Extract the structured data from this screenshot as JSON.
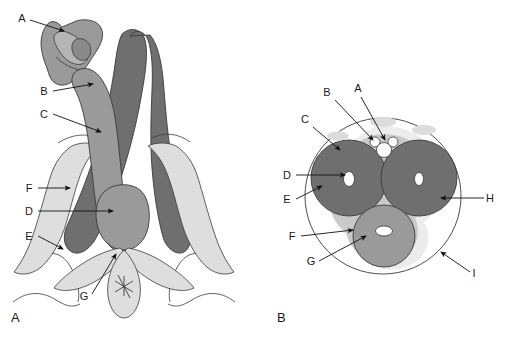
{
  "figure": {
    "background_color": "#ffffff",
    "width": 506,
    "height": 338
  },
  "palette": {
    "dark_gray": "#6f6f6f",
    "mid_gray": "#9a9a9a",
    "light_gray": "#c9c9c9",
    "pale_gray": "#dedede",
    "very_pale_gray": "#ececec",
    "outline": "#3a3a3a",
    "leader_line": "#111111",
    "label_text": "#1a1a1a",
    "white": "#ffffff"
  },
  "panels": [
    {
      "id": "panel-a",
      "caption": "A",
      "view": "coronal root view",
      "labels": [
        {
          "key": "A",
          "text": "A",
          "label_x": 22,
          "label_y": 22,
          "line": [
            [
              30,
              20
            ],
            [
              64,
              31
            ]
          ],
          "arrow_at": [
            64,
            31
          ]
        },
        {
          "key": "B",
          "text": "B",
          "label_x": 44,
          "label_y": 95,
          "line": [
            [
              53,
              91
            ],
            [
              93,
              84
            ]
          ],
          "arrow_at": [
            93,
            84
          ]
        },
        {
          "key": "C",
          "text": "C",
          "label_x": 44,
          "label_y": 118,
          "line": [
            [
              53,
              114
            ],
            [
              101,
              132
            ]
          ],
          "arrow_at": [
            101,
            132
          ]
        },
        {
          "key": "F",
          "text": "F",
          "label_x": 29,
          "label_y": 192,
          "line": [
            [
              38,
              188
            ],
            [
              70,
              188
            ]
          ],
          "arrow_at": [
            70,
            188
          ]
        },
        {
          "key": "D",
          "text": "D",
          "label_x": 29,
          "label_y": 215,
          "line": [
            [
              38,
              211
            ],
            [
              113,
              211
            ]
          ],
          "arrow_at": [
            113,
            211
          ]
        },
        {
          "key": "E",
          "text": "E",
          "label_x": 29,
          "label_y": 240,
          "line": [
            [
              38,
              236
            ],
            [
              63,
              249
            ]
          ],
          "arrow_at": [
            63,
            249
          ]
        },
        {
          "key": "G",
          "text": "G",
          "label_x": 84,
          "label_y": 300,
          "line": [
            [
              92,
              294
            ],
            [
              116,
              254
            ]
          ],
          "arrow_at": [
            116,
            254
          ]
        }
      ]
    },
    {
      "id": "panel-b",
      "caption": "B",
      "view": "shaft cross-section",
      "labels": [
        {
          "key": "A",
          "text": "A",
          "label_x": 358,
          "label_y": 92,
          "line": [
            [
              361,
              97
            ],
            [
              385,
              140
            ]
          ],
          "arrow_at": [
            385,
            140
          ]
        },
        {
          "key": "B",
          "text": "B",
          "label_x": 327,
          "label_y": 96,
          "line": [
            [
              335,
              100
            ],
            [
              373,
              140
            ]
          ],
          "arrow_at": [
            373,
            140
          ]
        },
        {
          "key": "C",
          "text": "C",
          "label_x": 305,
          "label_y": 123,
          "line": [
            [
              313,
              127
            ],
            [
              340,
              150
            ]
          ],
          "arrow_at": [
            340,
            150
          ]
        },
        {
          "key": "D",
          "text": "D",
          "label_x": 287,
          "label_y": 179,
          "line": [
            [
              296,
              175
            ],
            [
              345,
              175
            ]
          ],
          "arrow_at": [
            345,
            175
          ]
        },
        {
          "key": "E",
          "text": "E",
          "label_x": 287,
          "label_y": 203,
          "line": [
            [
              296,
              199
            ],
            [
              322,
              186
            ]
          ],
          "arrow_at": [
            322,
            186
          ]
        },
        {
          "key": "F",
          "text": "F",
          "label_x": 292,
          "label_y": 240,
          "line": [
            [
              301,
              236
            ],
            [
              353,
              230
            ]
          ],
          "arrow_at": [
            353,
            230
          ]
        },
        {
          "key": "G",
          "text": "G",
          "label_x": 311,
          "label_y": 265,
          "line": [
            [
              319,
              261
            ],
            [
              366,
              236
            ]
          ],
          "arrow_at": [
            366,
            236
          ]
        },
        {
          "key": "H",
          "text": "H",
          "label_x": 488,
          "label_y": 202,
          "line": [
            [
              484,
              198
            ],
            [
              441,
              198
            ]
          ],
          "arrow_at": [
            441,
            198
          ]
        },
        {
          "key": "I",
          "text": "I",
          "label_x": 473,
          "label_y": 277,
          "line": [
            [
              470,
              272
            ],
            [
              441,
              252
            ]
          ],
          "arrow_at": [
            441,
            252
          ]
        }
      ]
    }
  ]
}
